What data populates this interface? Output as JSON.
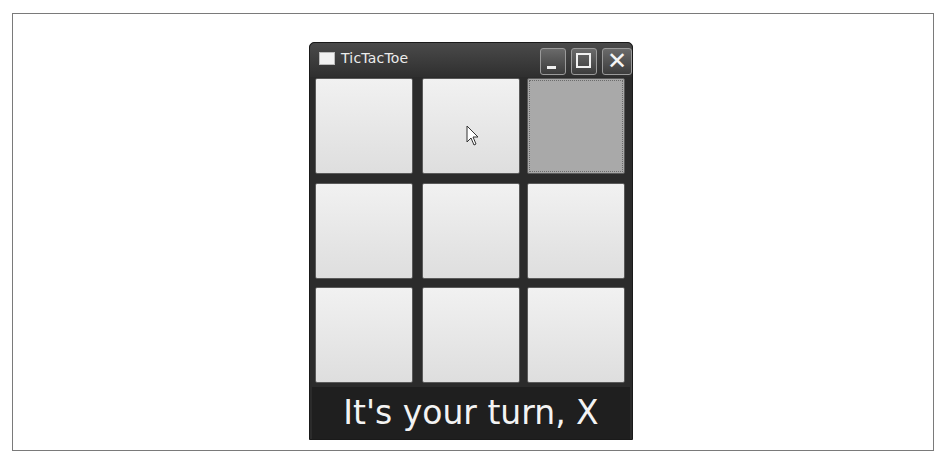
{
  "window": {
    "title": "TicTacToe",
    "icon": "app-window-icon",
    "controls": [
      {
        "name": "minimize",
        "icon": "minimize-icon"
      },
      {
        "name": "maximize",
        "icon": "maximize-icon"
      },
      {
        "name": "close",
        "icon": "close-icon",
        "glyph": "✕"
      }
    ]
  },
  "board": {
    "rows": 3,
    "cols": 3,
    "cells": [
      {
        "row": 0,
        "col": 0,
        "value": "",
        "focused": false
      },
      {
        "row": 0,
        "col": 1,
        "value": "",
        "focused": false
      },
      {
        "row": 0,
        "col": 2,
        "value": "",
        "focused": true
      },
      {
        "row": 1,
        "col": 0,
        "value": "",
        "focused": false
      },
      {
        "row": 1,
        "col": 1,
        "value": "",
        "focused": false
      },
      {
        "row": 1,
        "col": 2,
        "value": "",
        "focused": false
      },
      {
        "row": 2,
        "col": 0,
        "value": "",
        "focused": false
      },
      {
        "row": 2,
        "col": 1,
        "value": "",
        "focused": false
      },
      {
        "row": 2,
        "col": 2,
        "value": "",
        "focused": false
      }
    ]
  },
  "status": {
    "text": "It's your turn, X"
  },
  "colors": {
    "window_bg": "#2b2b2b",
    "cell_bg": "#e8e8e8",
    "focused_cell_bg": "#a9a9a9",
    "status_text": "#f3f3f3"
  }
}
